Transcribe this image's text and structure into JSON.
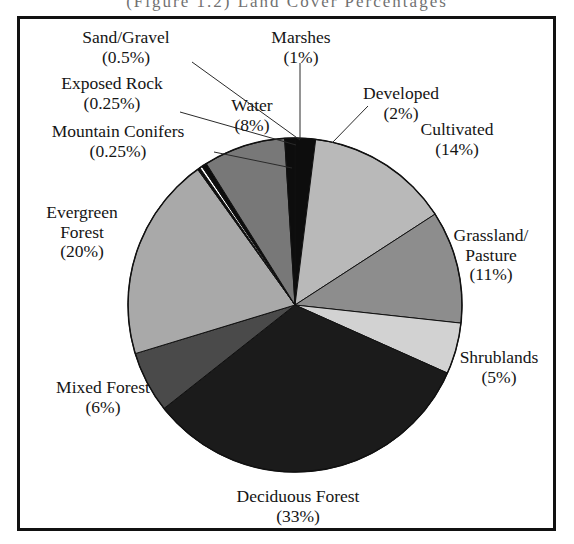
{
  "figure": {
    "top_caption_fragment": "(Figure 1.2)   Land Cover Percentages",
    "border_color": "#111111",
    "background": "#ffffff"
  },
  "chart_data": {
    "type": "pie",
    "title": "",
    "start_angle_deg": 0,
    "direction": "clockwise",
    "legend_position": "outside-labels-with-leader-lines",
    "categories": [
      "Developed",
      "Cultivated",
      "Grassland/Pasture",
      "Shrublands",
      "Deciduous Forest",
      "Mixed Forest",
      "Evergreen Forest",
      "Mountain Conifers",
      "Exposed Rock",
      "Sand/Gravel",
      "Water",
      "Marshes"
    ],
    "values": [
      2,
      14,
      11,
      5,
      33,
      6,
      20,
      0.25,
      0.25,
      0.5,
      8,
      1
    ],
    "value_labels": [
      "(2%)",
      "(14%)",
      "(11%)",
      "(5%)",
      "(33%)",
      "(6%)",
      "(20%)",
      "(0.25%)",
      "(0.25%)",
      "(0.5%)",
      "(8%)",
      "(1%)"
    ],
    "colors": [
      "#0d0d0d",
      "#b9b9b9",
      "#8d8d8d",
      "#d2d2d2",
      "#1b1b1b",
      "#4a4a4a",
      "#a9a9a9",
      "#0d0d0d",
      "#fdfdfd",
      "#0d0d0d",
      "#787878",
      "#0d0d0d"
    ],
    "slice_border_color": "#111111",
    "units": "percent"
  },
  "labels": {
    "sand_gravel": {
      "name": "Sand/Gravel",
      "pct": "(0.5%)"
    },
    "marshes": {
      "name": "Marshes",
      "pct": "(1%)"
    },
    "exposed_rock": {
      "name": "Exposed Rock",
      "pct": "(0.25%)"
    },
    "water": {
      "name": "Water",
      "pct": "(8%)"
    },
    "developed": {
      "name": "Developed",
      "pct": "(2%)"
    },
    "mountain_conifers": {
      "name": "Mountain Conifers",
      "pct": "(0.25%)"
    },
    "cultivated": {
      "name": "Cultivated",
      "pct": "(14%)"
    },
    "evergreen_forest": {
      "name": "Evergreen",
      "name2": "Forest",
      "pct": "(20%)"
    },
    "grassland_pasture": {
      "name": "Grassland/",
      "name2": "Pasture",
      "pct": "(11%)"
    },
    "shrublands": {
      "name": "Shrublands",
      "pct": "(5%)"
    },
    "mixed_forest": {
      "name": "Mixed Forest",
      "pct": "(6%)"
    },
    "deciduous_forest": {
      "name": "Deciduous Forest",
      "pct": "(33%)"
    }
  }
}
